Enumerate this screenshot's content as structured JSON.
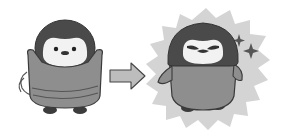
{
  "scene": {
    "description": "Before and after illustration of a baby penguin",
    "caption": "",
    "panels": [
      {
        "id": "before",
        "label": "Penguin twisting body with arms raised, motion lines"
      },
      {
        "id": "arrow",
        "label": "Right arrow"
      },
      {
        "id": "after",
        "label": "Confident penguin in spiky burst with sparkles"
      }
    ],
    "colors": {
      "background": "#ffffff",
      "head": "#4a4a4a",
      "face": "#f2f2f2",
      "body": "#8e8e8e",
      "outline": "#3a3a3a",
      "burst": "#d4d4d4",
      "arrow": "#bdbdbd",
      "feet": "#3c3c3c"
    }
  }
}
